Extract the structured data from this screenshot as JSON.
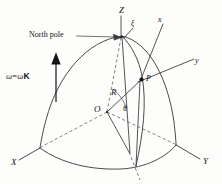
{
  "figure": {
    "kind": "geometry-diagram",
    "background_color": "#fdfdfc",
    "line_color": "#2b2b2b",
    "dashed_color": "#5a5a5a"
  },
  "labels": {
    "axis_z": "Z",
    "axis_x_capital": "X",
    "axis_y_capital": "Y",
    "axis_x_local": "x",
    "axis_y_local": "y",
    "axis_xi_local": "ξ",
    "north_pole": "North pole",
    "point_p": "P",
    "origin_o": "O",
    "radius_r": "R",
    "colatitude_theta": "θ",
    "omega_symbol": "ω",
    "omega_equals": "=",
    "omega_scalar": "ω",
    "omega_unit_vector": "K"
  },
  "annotations": {
    "omega_expression": "ω = ωK",
    "north_pole_leader": "leader-line-to-pole"
  }
}
